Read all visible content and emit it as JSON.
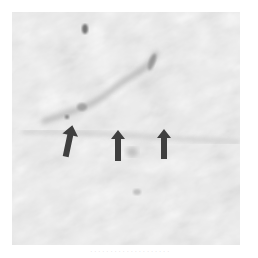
{
  "figure": {
    "type": "grayscale micrograph",
    "background_color": "#e9e9e9",
    "arrow_color": "#3f3f3f",
    "arrows": [
      {
        "id": 1,
        "x": 67,
        "y": 140,
        "direction": "up",
        "tilt_deg": 12
      },
      {
        "id": 2,
        "x": 118,
        "y": 143,
        "direction": "up",
        "tilt_deg": 0
      },
      {
        "id": 3,
        "x": 164,
        "y": 141,
        "direction": "up",
        "tilt_deg": 0
      }
    ],
    "caption": "· · · · · · · · · · · · · · · · · · · ·"
  }
}
